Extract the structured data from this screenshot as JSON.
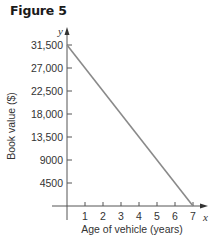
{
  "figure": {
    "label": "Figure 5"
  },
  "axes": {
    "x_var": "x",
    "y_var": "y",
    "x_title": "Age of vehicle (years)",
    "y_title": "Book value ($)"
  },
  "colors": {
    "line": "#8a8a8a",
    "axis": "#555555",
    "text": "#333333"
  },
  "y_ticks": [
    {
      "value": 31500,
      "label": "31,500"
    },
    {
      "value": 27000,
      "label": "27,000"
    },
    {
      "value": 22500,
      "label": "22,500"
    },
    {
      "value": 18000,
      "label": "18,000"
    },
    {
      "value": 13500,
      "label": "13,500"
    },
    {
      "value": 9000,
      "label": "9000"
    },
    {
      "value": 4500,
      "label": "4500"
    }
  ],
  "x_ticks": [
    {
      "value": 1,
      "label": "1"
    },
    {
      "value": 2,
      "label": "2"
    },
    {
      "value": 3,
      "label": "3"
    },
    {
      "value": 4,
      "label": "4"
    },
    {
      "value": 5,
      "label": "5"
    },
    {
      "value": 6,
      "label": "6"
    },
    {
      "value": 7,
      "label": "7"
    }
  ],
  "chart_data": {
    "type": "line",
    "title": "Figure 5",
    "xlabel": "Age of vehicle (years)",
    "ylabel": "Book value ($)",
    "x": [
      0,
      7
    ],
    "series": [
      {
        "name": "Book value",
        "values": [
          31500,
          0
        ]
      }
    ],
    "x_ticks": [
      1,
      2,
      3,
      4,
      5,
      6,
      7
    ],
    "y_ticks": [
      4500,
      9000,
      13500,
      18000,
      22500,
      27000,
      31500
    ],
    "xlim": [
      0,
      7.5
    ],
    "ylim": [
      0,
      34000
    ],
    "grid": false,
    "legend": "none"
  }
}
